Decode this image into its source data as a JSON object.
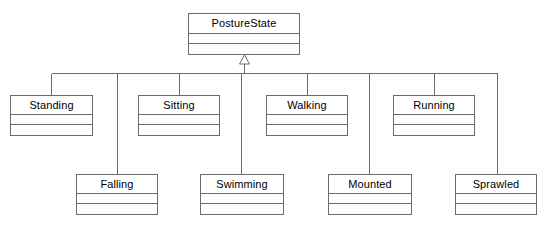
{
  "diagram": {
    "type": "uml-class-diagram",
    "title": "PostureState",
    "width": 549,
    "height": 231,
    "background_color": "#ffffff",
    "line_color": "#6b6b6b",
    "text_color": "#000000",
    "relationship": "generalization"
  },
  "root": {
    "name": "PostureState",
    "x": 188,
    "y": 13,
    "width": 112,
    "height": 42
  },
  "subclasses": [
    {
      "name": "Standing",
      "x": 10,
      "y": 95,
      "width": 83,
      "height": 41,
      "row": "top",
      "drop_x": 51
    },
    {
      "name": "Falling",
      "x": 76,
      "y": 174,
      "width": 82,
      "height": 41,
      "row": "bottom",
      "drop_x": 117
    },
    {
      "name": "Sitting",
      "x": 138,
      "y": 95,
      "width": 82,
      "height": 41,
      "row": "top",
      "drop_x": 179
    },
    {
      "name": "Swimming",
      "x": 200,
      "y": 174,
      "width": 84,
      "height": 41,
      "row": "bottom",
      "drop_x": 241
    },
    {
      "name": "Walking",
      "x": 266,
      "y": 95,
      "width": 82,
      "height": 41,
      "row": "top",
      "drop_x": 307
    },
    {
      "name": "Mounted",
      "x": 328,
      "y": 174,
      "width": 84,
      "height": 41,
      "row": "bottom",
      "drop_x": 369
    },
    {
      "name": "Running",
      "x": 393,
      "y": 95,
      "width": 82,
      "height": 41,
      "row": "top",
      "drop_x": 434
    },
    {
      "name": "Sprawled",
      "x": 455,
      "y": 174,
      "width": 82,
      "height": 41,
      "row": "bottom",
      "drop_x": 497
    }
  ],
  "connectors": {
    "bus_y": 73,
    "bus_x_start": 51,
    "bus_x_end": 497,
    "trunk_x": 244,
    "arrow_tip_y": 55,
    "arrow_base_y": 64,
    "arrow_half_width": 5
  }
}
